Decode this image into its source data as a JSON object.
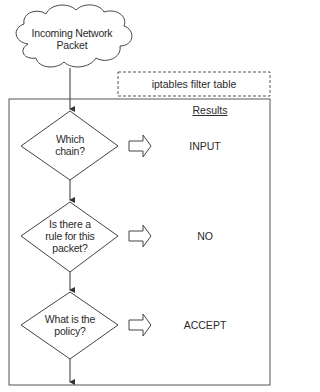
{
  "diagram": {
    "start_node": {
      "shape": "cloud",
      "label": "Incoming Network\nPacket",
      "line1": "Incoming Network",
      "line2": "Packet"
    },
    "container_label": "iptables filter table",
    "results_heading": "Results",
    "decisions": [
      {
        "question_line1": "Which",
        "question_line2": "chain?",
        "question_line3": "",
        "result": "INPUT"
      },
      {
        "question_line1": "Is there a",
        "question_line2": "rule for this",
        "question_line3": "packet?",
        "result": "NO"
      },
      {
        "question_line1": "What is the",
        "question_line2": "policy?",
        "question_line3": "",
        "result": "ACCEPT"
      }
    ],
    "colors": {
      "stroke": "#444444",
      "text": "#2a2a2a",
      "background": "#ffffff"
    }
  }
}
